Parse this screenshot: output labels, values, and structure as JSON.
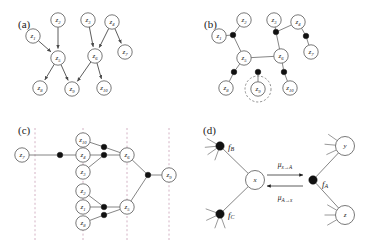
{
  "figure": {
    "panels": [
      {
        "id": "a",
        "label": "(a)",
        "caption_type": "directed-graph"
      },
      {
        "id": "b",
        "label": "(b)",
        "caption_type": "factor-graph"
      },
      {
        "id": "c",
        "label": "(c)",
        "caption_type": "factor-tree"
      },
      {
        "id": "d",
        "label": "(d)",
        "caption_type": "message-passing"
      }
    ]
  },
  "panel_a": {
    "label": "(a)",
    "type": "directed acyclic graph",
    "nodes": [
      {
        "id": "z1",
        "base": "z",
        "sub": "1",
        "x": 33,
        "y": 36
      },
      {
        "id": "z2",
        "base": "z",
        "sub": "2",
        "x": 58,
        "y": 20
      },
      {
        "id": "z3",
        "base": "z",
        "sub": "3",
        "x": 88,
        "y": 20
      },
      {
        "id": "z4",
        "base": "z",
        "sub": "4",
        "x": 112,
        "y": 22
      },
      {
        "id": "z5",
        "base": "z",
        "sub": "5",
        "x": 58,
        "y": 58
      },
      {
        "id": "z6",
        "base": "z",
        "sub": "6",
        "x": 95,
        "y": 56
      },
      {
        "id": "z7",
        "base": "z",
        "sub": "7",
        "x": 125,
        "y": 52
      },
      {
        "id": "z8",
        "base": "z",
        "sub": "8",
        "x": 40,
        "y": 88
      },
      {
        "id": "z9",
        "base": "z",
        "sub": "9",
        "x": 72,
        "y": 89
      },
      {
        "id": "z10",
        "base": "z",
        "sub": "10",
        "x": 104,
        "y": 88
      }
    ],
    "edges": [
      {
        "from": "z1",
        "to": "z5"
      },
      {
        "from": "z2",
        "to": "z5"
      },
      {
        "from": "z3",
        "to": "z6"
      },
      {
        "from": "z4",
        "to": "z6"
      },
      {
        "from": "z4",
        "to": "z7"
      },
      {
        "from": "z5",
        "to": "z8"
      },
      {
        "from": "z5",
        "to": "z9"
      },
      {
        "from": "z6",
        "to": "z9"
      },
      {
        "from": "z6",
        "to": "z10"
      }
    ]
  },
  "panel_b": {
    "label": "(b)",
    "type": "factor graph",
    "nodes": [
      {
        "id": "z1",
        "base": "z",
        "sub": "1",
        "x": 33,
        "y": 36
      },
      {
        "id": "z2",
        "base": "z",
        "sub": "2",
        "x": 58,
        "y": 20
      },
      {
        "id": "z3",
        "base": "z",
        "sub": "3",
        "x": 88,
        "y": 20
      },
      {
        "id": "z4",
        "base": "z",
        "sub": "4",
        "x": 112,
        "y": 22
      },
      {
        "id": "z5",
        "base": "z",
        "sub": "5",
        "x": 58,
        "y": 58
      },
      {
        "id": "z6",
        "base": "z",
        "sub": "6",
        "x": 95,
        "y": 56
      },
      {
        "id": "z7",
        "base": "z",
        "sub": "7",
        "x": 125,
        "y": 52
      },
      {
        "id": "z8",
        "base": "z",
        "sub": "8",
        "x": 40,
        "y": 88
      },
      {
        "id": "z9",
        "base": "z",
        "sub": "9",
        "x": 72,
        "y": 89
      },
      {
        "id": "z10",
        "base": "z",
        "sub": "10",
        "x": 104,
        "y": 88
      }
    ],
    "factors": [
      {
        "id": "f-z5",
        "x": 47,
        "y": 35
      },
      {
        "id": "f-z6",
        "x": 90,
        "y": 32
      },
      {
        "id": "f-z7",
        "x": 120,
        "y": 36
      },
      {
        "id": "f-z8",
        "x": 48,
        "y": 72
      },
      {
        "id": "f-z9",
        "x": 72,
        "y": 72
      },
      {
        "id": "f-z10",
        "x": 98,
        "y": 72
      }
    ],
    "edges": [
      {
        "from": "z1",
        "to": "f-z5"
      },
      {
        "from": "z2",
        "to": "f-z5"
      },
      {
        "from": "f-z5",
        "to": "z5"
      },
      {
        "from": "z3",
        "to": "f-z6"
      },
      {
        "from": "z4",
        "to": "f-z6"
      },
      {
        "from": "f-z6",
        "to": "z6"
      },
      {
        "from": "z4",
        "to": "f-z7"
      },
      {
        "from": "f-z7",
        "to": "z7"
      },
      {
        "from": "z5",
        "to": "f-z8"
      },
      {
        "from": "f-z8",
        "to": "z8"
      },
      {
        "from": "z5",
        "to": "z6"
      },
      {
        "from": "f-z9",
        "to": "z9"
      },
      {
        "from": "z6",
        "to": "f-z10"
      },
      {
        "from": "f-z10",
        "to": "z10"
      }
    ],
    "highlight": {
      "node": "z9",
      "style": "dashed-circle",
      "x": 72,
      "y": 89,
      "r": 13
    }
  },
  "panel_c": {
    "label": "(c)",
    "type": "rearranged factor tree",
    "nodes": [
      {
        "id": "z7",
        "base": "z",
        "sub": "7",
        "x": 22,
        "y": 33
      },
      {
        "id": "z10",
        "base": "z",
        "sub": "10",
        "x": 83,
        "y": 18
      },
      {
        "id": "z4",
        "base": "z",
        "sub": "4",
        "x": 83,
        "y": 33
      },
      {
        "id": "z3",
        "base": "z",
        "sub": "3",
        "x": 83,
        "y": 50
      },
      {
        "id": "z6",
        "base": "z",
        "sub": "6",
        "x": 127,
        "y": 33
      },
      {
        "id": "z2",
        "base": "z",
        "sub": "2",
        "x": 83,
        "y": 69
      },
      {
        "id": "z1",
        "base": "z",
        "sub": "1",
        "x": 83,
        "y": 85
      },
      {
        "id": "z8",
        "base": "z",
        "sub": "8",
        "x": 83,
        "y": 101
      },
      {
        "id": "z5",
        "base": "z",
        "sub": "5",
        "x": 127,
        "y": 85
      },
      {
        "id": "z9",
        "base": "z",
        "sub": "9",
        "x": 169,
        "y": 53
      }
    ],
    "factors": [
      {
        "id": "f-c1",
        "x": 60,
        "y": 33
      },
      {
        "id": "f-c2",
        "x": 104,
        "y": 25
      },
      {
        "id": "f-c3",
        "x": 104,
        "y": 33
      },
      {
        "id": "f-c4",
        "x": 104,
        "y": 85
      },
      {
        "id": "f-c5",
        "x": 104,
        "y": 93
      },
      {
        "id": "f-c6",
        "x": 148,
        "y": 53
      }
    ],
    "edges": [
      {
        "from": "z7",
        "to": "f-c1"
      },
      {
        "from": "f-c1",
        "to": "z4"
      },
      {
        "from": "z10",
        "to": "f-c2"
      },
      {
        "from": "f-c2",
        "to": "z6"
      },
      {
        "from": "z4",
        "to": "f-c3"
      },
      {
        "from": "z3",
        "to": "f-c3"
      },
      {
        "from": "f-c3",
        "to": "z6"
      },
      {
        "from": "z2",
        "to": "f-c4"
      },
      {
        "from": "z1",
        "to": "f-c4"
      },
      {
        "from": "f-c4",
        "to": "z5"
      },
      {
        "from": "z8",
        "to": "f-c5"
      },
      {
        "from": "f-c5",
        "to": "z5"
      },
      {
        "from": "z6",
        "to": "f-c6"
      },
      {
        "from": "z5",
        "to": "f-c6"
      },
      {
        "from": "f-c6",
        "to": "z9"
      }
    ],
    "guide_lines": [
      {
        "id": "guide-1",
        "x": 35
      },
      {
        "id": "guide-2",
        "x": 83
      },
      {
        "id": "guide-3",
        "x": 127
      },
      {
        "id": "guide-4",
        "x": 169
      }
    ]
  },
  "panel_d": {
    "label": "(d)",
    "type": "message passing detail",
    "variables": [
      {
        "id": "x",
        "base": "x",
        "sub": "",
        "x": 70,
        "y": 58
      },
      {
        "id": "y",
        "base": "y",
        "sub": "",
        "x": 160,
        "y": 24
      },
      {
        "id": "z",
        "base": "z",
        "sub": "",
        "x": 160,
        "y": 93
      }
    ],
    "factors": [
      {
        "id": "fB",
        "base": "f",
        "sub": "B",
        "x": 35,
        "y": 24,
        "label_dx": 8,
        "label_dy": 1
      },
      {
        "id": "fC",
        "base": "f",
        "sub": "C",
        "x": 35,
        "y": 92,
        "label_dx": 8,
        "label_dy": 1
      },
      {
        "id": "fA",
        "base": "f",
        "sub": "A",
        "x": 128,
        "y": 58,
        "label_dx": 9,
        "label_dy": 4
      }
    ],
    "edges": [
      {
        "from": "fB",
        "to": "x"
      },
      {
        "from": "fC",
        "to": "x"
      },
      {
        "from": "fA",
        "to": "y"
      },
      {
        "from": "fA",
        "to": "z"
      }
    ],
    "messages": [
      {
        "id": "mu-x-to-A",
        "base": "μ",
        "sub": "x→A",
        "direction": "right",
        "x1": 82,
        "x2": 118,
        "y": 53,
        "label_x": 100,
        "label_y": 42
      },
      {
        "id": "mu-A-to-x",
        "base": "μ",
        "sub": "A→x",
        "direction": "left",
        "x1": 118,
        "x2": 82,
        "y": 64,
        "label_x": 100,
        "label_y": 75
      }
    ],
    "stubs": [
      {
        "node": "fB",
        "angles": [
          200,
          235,
          265,
          300
        ]
      },
      {
        "node": "fC",
        "angles": [
          160,
          200,
          245,
          290
        ]
      },
      {
        "node": "y",
        "angles": [
          245,
          275,
          305
        ]
      },
      {
        "node": "z",
        "angles": [
          240,
          270,
          300
        ]
      }
    ]
  },
  "colors": {
    "node_stroke": "#555555",
    "node_fill": "#ffffff",
    "factor_fill": "#111111",
    "edge": "#666666",
    "guide_line": "#c08fa8",
    "text": "#1a1a1a"
  }
}
